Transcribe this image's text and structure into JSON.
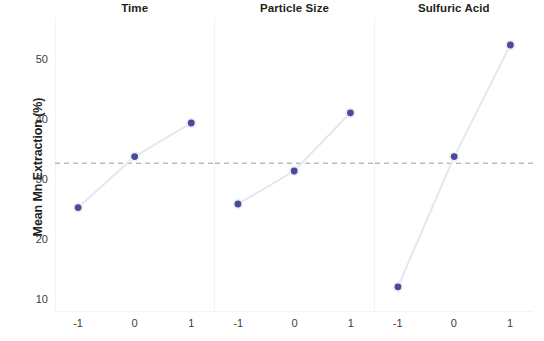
{
  "chart_data": {
    "type": "line",
    "title": "",
    "subtitle": "",
    "xlabel": "",
    "ylabel": "Mean Mn Extraction (%)",
    "ylim": [
      8,
      55
    ],
    "yticks": [
      10,
      20,
      30,
      40,
      50
    ],
    "ytick_labels": [
      "10",
      "20",
      "30",
      "40",
      "50"
    ],
    "xticks": [
      -1,
      0,
      1
    ],
    "xtick_labels": [
      "-1",
      "0",
      "1"
    ],
    "grid": false,
    "legend": "none",
    "reference_line": {
      "value": 32.8,
      "style": "dashed",
      "color": "#9a9aa8"
    },
    "marker_color": "#4a4a9c",
    "line_color": "#e6e6f0",
    "panels": [
      {
        "label": "Time",
        "categories": [
          "-1",
          "0",
          "1"
        ],
        "x": [
          -1,
          0,
          1
        ],
        "values": [
          25.4,
          33.9,
          39.5
        ]
      },
      {
        "label": "Particle Size",
        "categories": [
          "-1",
          "0",
          "1"
        ],
        "x": [
          -1,
          0,
          1
        ],
        "values": [
          26.0,
          31.5,
          41.2
        ]
      },
      {
        "label": "Sulfuric Acid",
        "categories": [
          "-1",
          "0",
          "1"
        ],
        "x": [
          -1,
          0,
          1
        ],
        "values": [
          12.2,
          33.9,
          52.5
        ]
      }
    ]
  }
}
